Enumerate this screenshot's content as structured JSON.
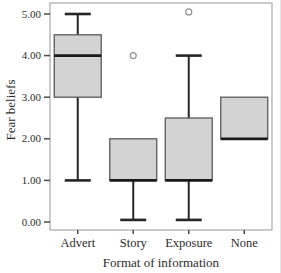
{
  "figure": {
    "background": "#ffffff"
  },
  "chart_data": {
    "type": "boxplot",
    "title": "",
    "xlabel": "Format of information",
    "ylabel": "Fear beliefs",
    "categories": [
      "Advert",
      "Story",
      "Exposure",
      "None"
    ],
    "ylim": [
      0.0,
      5.0
    ],
    "ytick_labels": [
      "0.00",
      "1.00",
      "2.00",
      "3.00",
      "4.00",
      "5.00"
    ],
    "grid": false,
    "legend": "none",
    "boxes": [
      {
        "category": "Advert",
        "whisker_low": 1.0,
        "q1": 3.0,
        "median": 4.0,
        "q3": 4.5,
        "whisker_high": 5.0,
        "outliers": []
      },
      {
        "category": "Story",
        "whisker_low": 0.05,
        "q1": 1.0,
        "median": 1.0,
        "q3": 2.0,
        "whisker_high": 2.0,
        "outliers": [
          4.0
        ]
      },
      {
        "category": "Exposure",
        "whisker_low": 0.05,
        "q1": 1.0,
        "median": 1.0,
        "q3": 2.5,
        "whisker_high": 4.0,
        "outliers": [
          5.05
        ]
      },
      {
        "category": "None",
        "whisker_low": 2.0,
        "q1": 2.0,
        "median": 2.0,
        "q3": 3.0,
        "whisker_high": 3.0,
        "outliers": []
      }
    ],
    "colors": {
      "box_fill": "#d3d3d3",
      "box_border": "#5a5a5a",
      "median": "#1a1a1a",
      "whisker": "#262626",
      "outlier_stroke": "#909090",
      "frame": "#a8a8a8",
      "tick": "#4a4a4a",
      "text": "#2b2b2b"
    }
  }
}
